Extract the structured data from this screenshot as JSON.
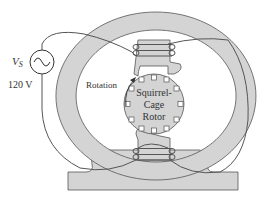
{
  "diagram": {
    "type": "single-phase induction motor with squirrel-cage rotor",
    "source": {
      "symbol_label": "V",
      "symbol_subscript": "S",
      "voltage_label": "120 V",
      "icon": "ac-source-icon"
    },
    "rotor": {
      "line1": "Squirrel-",
      "line2": "Cage",
      "line3": "Rotor"
    },
    "rotation_label": "Rotation",
    "colors": {
      "stator_fill": "#d4d4d4",
      "rotor_fill": "#d4d4d4",
      "outline": "#555555",
      "wire": "#555555",
      "text": "#333333",
      "background": "#ffffff"
    }
  }
}
